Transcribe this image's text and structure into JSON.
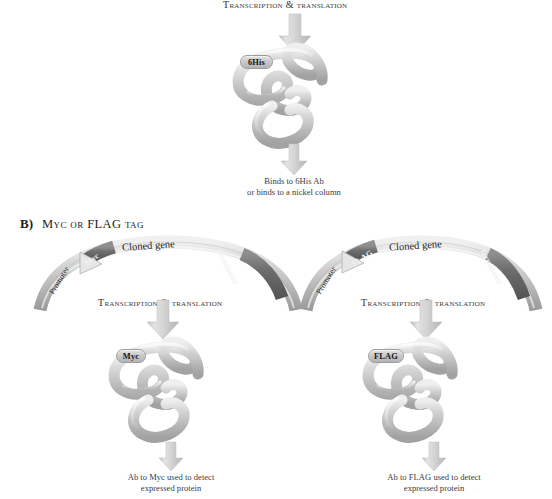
{
  "figure": {
    "background": "#ffffff",
    "ink": "#2b2b2b",
    "ribbon_light": "#c9c9c9",
    "ribbon_dark": "#6f6f6f",
    "arrow_fill": "#cccccc"
  },
  "panel_a": {
    "step_label": "Transcription & translation",
    "protein": {
      "tag": "6His",
      "name": "tagged-protein"
    },
    "result_caption_line1": "Binds to 6His Ab",
    "result_caption_line2": "or binds to a nickel column"
  },
  "panel_b": {
    "letter": "B)",
    "title": "Myc or FLAG tag",
    "left": {
      "plasmid": {
        "promoter_label": "Promoter",
        "tag_label": "Myc",
        "gene_label": "Cloned gene",
        "terminator_label": "Terminator"
      },
      "step_label": "Transcription & translation",
      "protein_tag": "Myc",
      "caption_line1": "Ab to Myc used to detect",
      "caption_line2": "expressed protein"
    },
    "right": {
      "plasmid": {
        "promoter_label": "Promoter",
        "tag_label": "FLAG",
        "gene_label": "Cloned gene",
        "terminator_label": "Terminator"
      },
      "step_label": "Transcription & translation",
      "protein_tag": "FLAG",
      "caption_line1": "Ab to FLAG used to detect",
      "caption_line2": "expressed protein"
    }
  }
}
